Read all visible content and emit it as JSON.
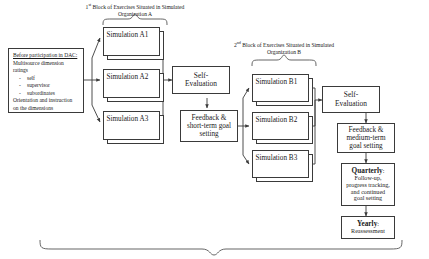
{
  "diagram": {
    "headers": {
      "block_a": {
        "ordinal": "1",
        "suffix": "st",
        "line1": " Block of Exercises Situated in Simulated",
        "line2": "Organization A"
      },
      "block_b": {
        "ordinal": "2",
        "suffix": "nd",
        "line1": " Block of Exercises Situated in Simulated",
        "line2": "Organization B"
      }
    },
    "pre_box": {
      "title": "Before participation in DAC:",
      "line1": "Multisource dimension",
      "line2": "ratings",
      "bullets": [
        "self",
        "supervisor",
        "subordinates"
      ],
      "line3": "Orientation and instruction",
      "line4": "on the dimensions"
    },
    "block_a_sims": [
      {
        "label": "Simulation A1"
      },
      {
        "label": "Simulation A2"
      },
      {
        "label": "Simulation A3"
      }
    ],
    "block_b_sims": [
      {
        "label": "Simulation B1"
      },
      {
        "label": "Simulation B2"
      },
      {
        "label": "Simulation B3"
      }
    ],
    "self_eval_a": {
      "line1": "Self-",
      "line2": "Evaluation"
    },
    "self_eval_b": {
      "line1": "Self-",
      "line2": "Evaluation"
    },
    "feedback_short": {
      "line1": "Feedback &",
      "line2": "short-term goal",
      "line3": "setting"
    },
    "feedback_medium": {
      "line1": "Feedback &",
      "line2": "medium-term",
      "line3": "goal setting"
    },
    "quarterly": {
      "heading": "Quarterly",
      "colon": ":",
      "line1": "Follow-up,",
      "line2": "progress tracking,",
      "line3": "and continued",
      "line4": "goal setting"
    },
    "yearly": {
      "heading": "Yearly",
      "colon": ":",
      "line1": "Reassessment"
    },
    "colors": {
      "stroke": "#3a3a3a",
      "background": "#ffffff",
      "text": "#1a1a1a"
    }
  }
}
